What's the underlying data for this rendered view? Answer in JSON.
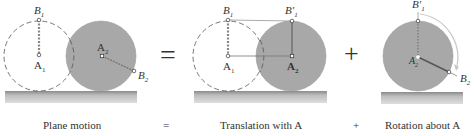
{
  "colors": {
    "disk_fill": "#a8a8a8",
    "disk_stroke": "#9a9a9a",
    "ground_top": "#8e8e8e",
    "ground_bottom": "#d8d8d8",
    "dashed": "#555555",
    "line": "#777777",
    "text": "#333333"
  },
  "panels": [
    {
      "name": "plane-motion",
      "labels": {
        "b1": "B",
        "b1_sub": "1",
        "a1": "A",
        "a1_sub": "1",
        "a2": "A",
        "a2_sub": "2",
        "b2": "B",
        "b2_sub": "2"
      },
      "caption": "Plane motion"
    },
    {
      "name": "translation",
      "labels": {
        "b1": "B",
        "b1_sub": "1",
        "a1": "A",
        "a1_sub": "1",
        "b1p": "B′",
        "b1p_sub": "1",
        "a2": "A",
        "a2_sub": "2"
      },
      "caption": "Translation with A"
    },
    {
      "name": "rotation",
      "labels": {
        "b1p": "B′",
        "b1p_sub": "1",
        "a2": "A",
        "a2_sub": "2",
        "b2": "B",
        "b2_sub": "2"
      },
      "caption": "Rotation about A"
    }
  ],
  "operators": {
    "equals": "=",
    "plus": "+"
  },
  "caption_operators": {
    "equals": "=",
    "plus": "+"
  }
}
